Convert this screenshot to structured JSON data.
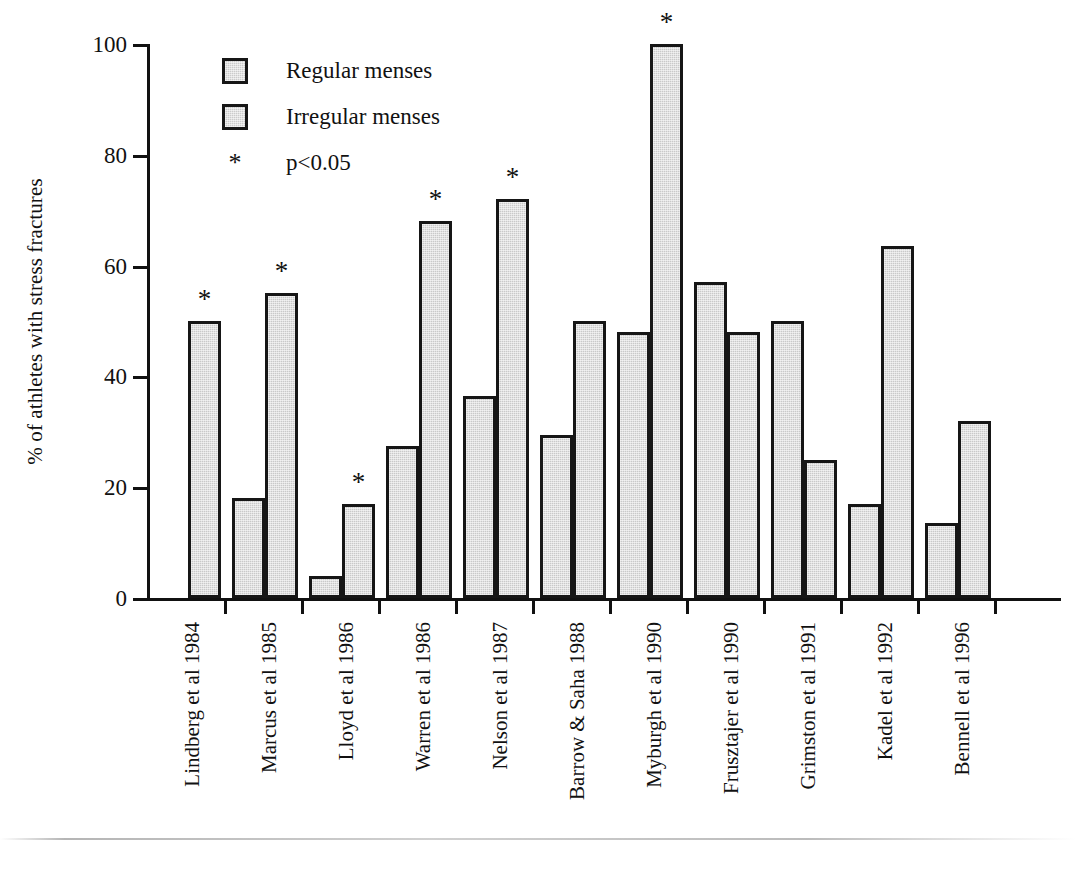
{
  "chart_data": {
    "type": "bar",
    "title": "",
    "xlabel": "",
    "ylabel": "% of athletes with stress fractures",
    "ylim": [
      0,
      100
    ],
    "yticks": [
      "0",
      "20",
      "40",
      "60",
      "80",
      "100"
    ],
    "grid": false,
    "legend_position": "top-left",
    "categories": [
      "Lindberg et al 1984",
      "Marcus et al 1985",
      "Lloyd et al 1986",
      "Warren et al 1986",
      "Nelson et al 1987",
      "Barrow & Saha 1988",
      "Myburgh et al 1990",
      "Frusztajer et al 1990",
      "Grimston et al 1991",
      "Kadel et al 1992",
      "Bennell et al 1996"
    ],
    "series": [
      {
        "name": "Regular menses",
        "values": [
          null,
          18,
          4,
          27.5,
          36.5,
          29.5,
          48,
          57,
          50,
          17,
          13.5
        ]
      },
      {
        "name": "Irregular menses",
        "values": [
          50,
          55,
          17,
          68,
          72,
          50,
          100,
          48,
          25,
          63.5,
          32
        ]
      }
    ],
    "significance_marker": "*",
    "significant_categories": [
      true,
      true,
      true,
      true,
      true,
      false,
      true,
      false,
      false,
      false,
      false
    ],
    "annotations": [
      "* p<0.05"
    ]
  },
  "legend": {
    "items": [
      {
        "marker": "swatch",
        "label": "Regular menses"
      },
      {
        "marker": "swatch",
        "label": "Irregular menses"
      },
      {
        "marker": "star",
        "label": "p<0.05",
        "symbol": "*"
      }
    ]
  },
  "axis": {
    "y_title": "% of athletes with stress fractures",
    "y_ticks": [
      "100",
      "80",
      "60",
      "40",
      "20",
      "0"
    ]
  }
}
